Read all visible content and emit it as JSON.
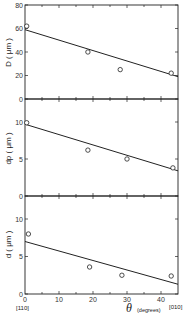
{
  "chart_data": [
    {
      "type": "scatter",
      "title": "",
      "xlabel": "θ (degrees)",
      "ylabel": "D (μm)",
      "xlim": [
        0,
        45
      ],
      "ylim": [
        0,
        80
      ],
      "yticks": [
        0,
        20,
        40,
        60,
        80
      ],
      "points": [
        {
          "x": 0.5,
          "y": 62
        },
        {
          "x": 18.5,
          "y": 40
        },
        {
          "x": 28,
          "y": 25
        },
        {
          "x": 43,
          "y": 22
        }
      ],
      "fit_line": {
        "x": [
          0,
          45
        ],
        "y": [
          59,
          19
        ]
      }
    },
    {
      "type": "scatter",
      "title": "",
      "xlabel": "θ (degrees)",
      "ylabel": "d_p (μm)",
      "xlim": [
        0,
        45
      ],
      "ylim": [
        0,
        13
      ],
      "yticks": [
        0,
        5,
        10
      ],
      "points": [
        {
          "x": 0.5,
          "y": 9.9
        },
        {
          "x": 18.5,
          "y": 6.2
        },
        {
          "x": 30,
          "y": 5.0
        },
        {
          "x": 43.5,
          "y": 3.8
        }
      ],
      "fit_line": {
        "x": [
          0,
          45
        ],
        "y": [
          9.7,
          3.4
        ]
      }
    },
    {
      "type": "scatter",
      "title": "",
      "xlabel": "θ (degrees)",
      "ylabel": "d (μm)",
      "xlim": [
        0,
        45
      ],
      "ylim": [
        0,
        13
      ],
      "yticks": [
        0,
        5,
        10
      ],
      "xticks": [
        0,
        10,
        20,
        30,
        40
      ],
      "points": [
        {
          "x": 1,
          "y": 8.0
        },
        {
          "x": 19,
          "y": 3.6
        },
        {
          "x": 28.5,
          "y": 2.5
        },
        {
          "x": 43,
          "y": 2.4
        }
      ],
      "fit_line": {
        "x": [
          0,
          45
        ],
        "y": [
          7.0,
          1.3
        ]
      }
    }
  ],
  "labels": {
    "panel1_y": "D ( μm )",
    "panel2_y": "dp ( μm )",
    "panel3_y": "d ( μm )",
    "x_axis_symbol": "θ",
    "x_axis_unit": "(degrees)",
    "x_left_direction": "[110]",
    "x_right_direction": "[010]",
    "p1_ticks": [
      "0",
      "20",
      "40",
      "60",
      "80"
    ],
    "p2_ticks": [
      "0",
      "5",
      "10"
    ],
    "p3_ticks": [
      "0",
      "5",
      "10"
    ],
    "x_ticks": [
      "0",
      "10",
      "20",
      "30",
      "40"
    ]
  },
  "colors": {
    "ink": "#222222",
    "background": "#ffffff"
  }
}
